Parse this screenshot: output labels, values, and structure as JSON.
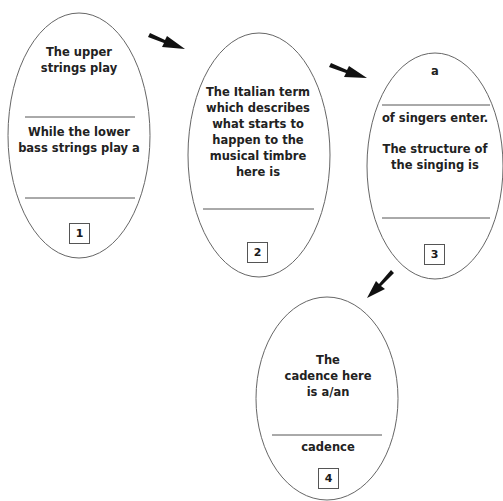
{
  "diagram": {
    "type": "sequence-of-ovals",
    "stroke_color": "#666666",
    "arrow_color": "#111111",
    "steps": [
      {
        "number": "1",
        "prompt_top": [
          "The upper",
          "strings play"
        ],
        "prompt_middle": [
          "While the lower",
          "bass strings play a"
        ],
        "blanks": 2
      },
      {
        "number": "2",
        "prompt_top": [
          "The Italian term",
          "which describes",
          "what starts to",
          "happen to the",
          "musical timbre",
          "here is"
        ],
        "blanks": 1
      },
      {
        "number": "3",
        "prompt_top": [
          "a"
        ],
        "prompt_middle": [
          "of singers enter."
        ],
        "prompt_lower": [
          "The structure of",
          "the singing is"
        ],
        "blanks": 2
      },
      {
        "number": "4",
        "prompt_top": [
          "The",
          "cadence here",
          "is a/an"
        ],
        "suffix": "cadence",
        "blanks": 1
      }
    ],
    "arrows": [
      {
        "from": "1",
        "to": "2",
        "direction": "down-right"
      },
      {
        "from": "2",
        "to": "3",
        "direction": "down-right"
      },
      {
        "from": "3",
        "to": "4",
        "direction": "down-left"
      }
    ]
  },
  "text": {
    "s1_l1": "The upper",
    "s1_l2": "strings play",
    "s1_l3": "While the lower",
    "s1_l4": "bass strings play a",
    "s2_l1": "The Italian term",
    "s2_l2": "which describes",
    "s2_l3": "what starts to",
    "s2_l4": "happen to the",
    "s2_l5": "musical timbre",
    "s2_l6": "here is",
    "s3_l1": "a",
    "s3_l2": "of singers enter.",
    "s3_l3": "The structure of",
    "s3_l4": "the singing is",
    "s4_l1": "The",
    "s4_l2": "cadence here",
    "s4_l3": "is a/an",
    "s4_l4": "cadence",
    "n1": "1",
    "n2": "2",
    "n3": "3",
    "n4": "4"
  }
}
